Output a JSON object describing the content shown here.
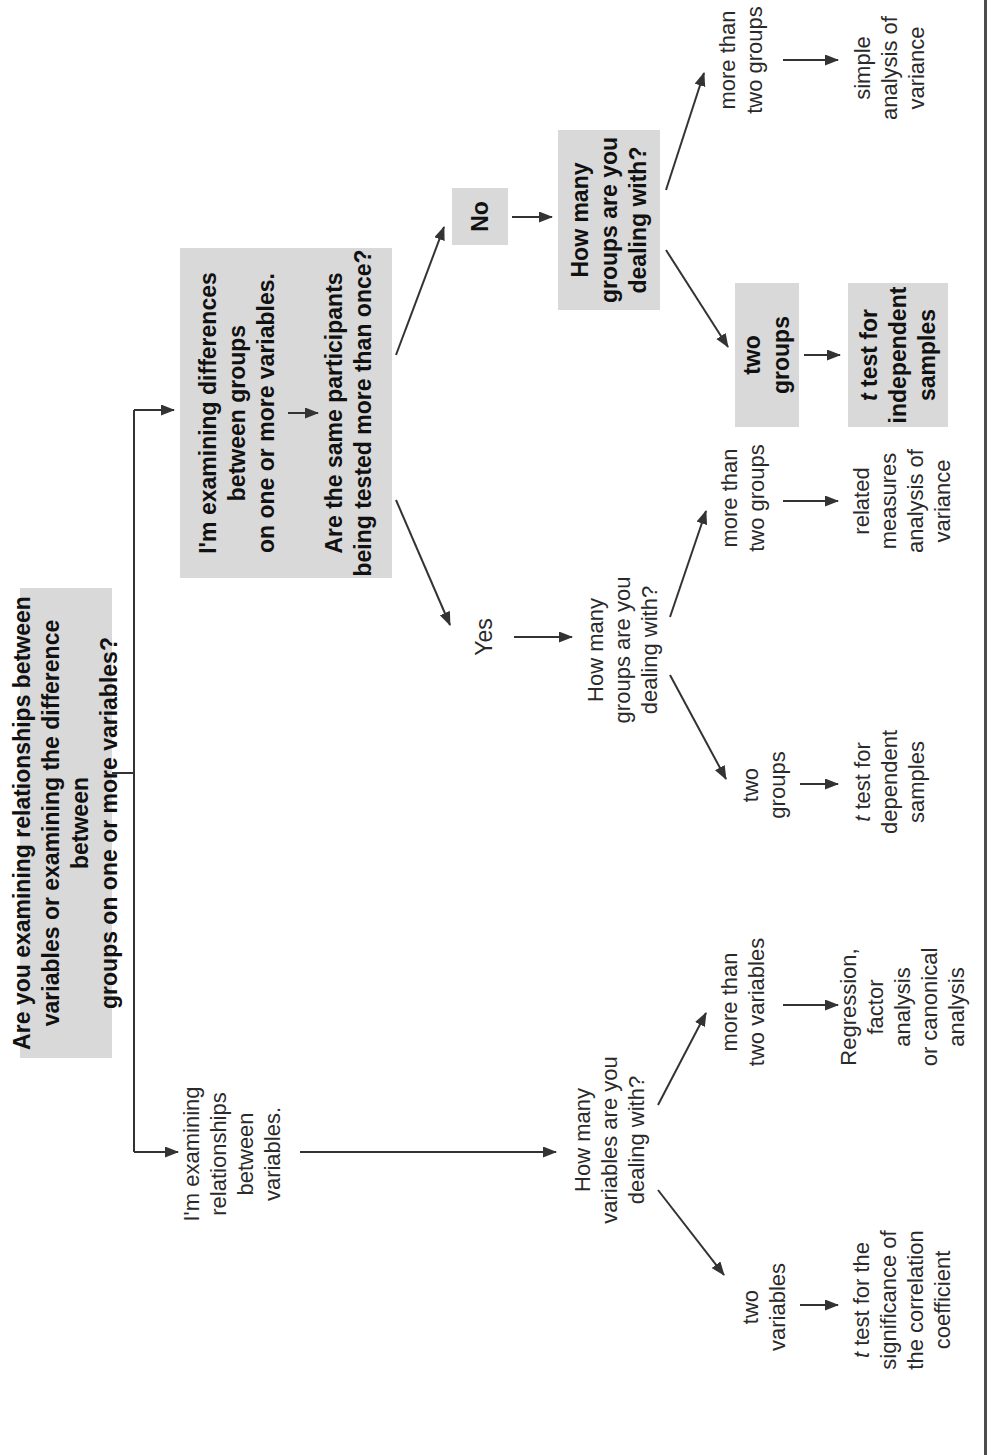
{
  "figure": {
    "root_question": "Are you examining relationships between\nvariables or examining the difference between\ngroups on one or more variables?",
    "branches": {
      "differences": {
        "statement": "I'm examining differences\nbetween groups\non one or more variables.",
        "followup_question": "Are the same participants\nbeing tested more than once?",
        "answers": {
          "no": {
            "label": "No",
            "question": "How many\ngroups are you\ndealing with?",
            "options": {
              "more_than_two_groups": {
                "label": "more than\ntwo groups",
                "outcome": [
                  {
                    "text": "simple\nanalysis of\nvariance"
                  }
                ]
              },
              "two_groups": {
                "label": "two\ngroups",
                "outcome": [
                  {
                    "text": "t",
                    "italic": true
                  },
                  {
                    "text": " test for\nindependent\nsamples"
                  }
                ]
              }
            }
          },
          "yes": {
            "label": "Yes",
            "question": "How many\ngroups are you\ndealing with?",
            "options": {
              "more_than_two_groups": {
                "label": "more than\ntwo groups",
                "outcome": [
                  {
                    "text": "related\nmeasures\nanalysis of\nvariance"
                  }
                ]
              },
              "two_groups": {
                "label": "two\ngroups",
                "outcome": [
                  {
                    "text": "t",
                    "italic": true
                  },
                  {
                    "text": " test for\ndependent\nsamples"
                  }
                ]
              }
            }
          }
        }
      },
      "relationships": {
        "statement": "I'm examining\nrelationships\nbetween variables.",
        "question": "How many\nvariables are you\ndealing with?",
        "options": {
          "more_than_two_variables": {
            "label": "more than\ntwo variables",
            "outcome": [
              {
                "text": "Regression,\nfactor analysis\nor canonical\nanalysis"
              }
            ]
          },
          "two_variables": {
            "label": "two\nvariables",
            "outcome": [
              {
                "text": "t",
                "italic": true
              },
              {
                "text": " test for the\nsignificance of\nthe correlation\ncoefficient"
              }
            ]
          }
        }
      }
    },
    "colors": {
      "highlight_fill": "#d9d9d9",
      "line": "#333333",
      "text": "#2a2a2a"
    }
  }
}
